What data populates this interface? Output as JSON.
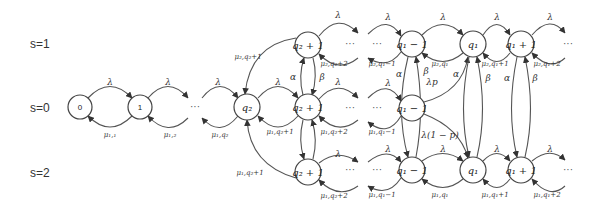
{
  "row_labels": [
    {
      "id": "s1",
      "text": "s=1",
      "x": 30,
      "y": 48
    },
    {
      "id": "s0",
      "text": "s=0",
      "x": 30,
      "y": 112
    },
    {
      "id": "s2",
      "text": "s=2",
      "x": 30,
      "y": 177
    }
  ],
  "nodes": [
    {
      "id": "n0",
      "label": "0",
      "x": 80,
      "y": 107,
      "r": 12,
      "plain": true
    },
    {
      "id": "n1",
      "label": "1",
      "x": 140,
      "y": 107,
      "r": 12,
      "plain": true
    },
    {
      "id": "nq2",
      "label": "q₂",
      "x": 247,
      "y": 107,
      "r": 13
    },
    {
      "id": "nq2p1_s1",
      "label": "q₂ + 1",
      "x": 308,
      "y": 45,
      "r": 13
    },
    {
      "id": "nq2p1_s0",
      "label": "q₂ + 1",
      "x": 308,
      "y": 107,
      "r": 13
    },
    {
      "id": "nq2p1_s2",
      "label": "q₂ + 1",
      "x": 308,
      "y": 172,
      "r": 13
    },
    {
      "id": "nq1m1_s1",
      "label": "q₁ − 1",
      "x": 412,
      "y": 44,
      "r": 13
    },
    {
      "id": "nq1_s1",
      "label": "q₁",
      "x": 473,
      "y": 44,
      "r": 13
    },
    {
      "id": "nq1p1_s1",
      "label": "q₁ + 1",
      "x": 521,
      "y": 44,
      "r": 13
    },
    {
      "id": "nq1m1_s0",
      "label": "q₁ − 1",
      "x": 412,
      "y": 108,
      "r": 13
    },
    {
      "id": "nq1m1_s2",
      "label": "q₁ − 1",
      "x": 412,
      "y": 170,
      "r": 13
    },
    {
      "id": "nq1_s2",
      "label": "q₁",
      "x": 473,
      "y": 170,
      "r": 13
    },
    {
      "id": "nq1p1_s2",
      "label": "q₁ + 1",
      "x": 521,
      "y": 170,
      "r": 13
    }
  ],
  "ellipses": [
    {
      "id": "dots_s0_a",
      "text": "···",
      "x": 195,
      "y": 110
    },
    {
      "id": "dots_s1_a",
      "text": "···",
      "x": 377,
      "y": 47
    },
    {
      "id": "dots_s0_b",
      "text": "···",
      "x": 377,
      "y": 111
    },
    {
      "id": "dots_s2_a",
      "text": "···",
      "x": 377,
      "y": 173
    },
    {
      "id": "dots_s1_end",
      "text": "···",
      "x": 568,
      "y": 47
    },
    {
      "id": "dots_s2_end",
      "text": "···",
      "x": 568,
      "y": 173
    },
    {
      "id": "dots_s0_q2",
      "text": "···",
      "x": 350,
      "y": 111
    },
    {
      "id": "dots_s1_q2",
      "text": "···",
      "x": 350,
      "y": 47
    },
    {
      "id": "dots_s2_q2",
      "text": "···",
      "x": 350,
      "y": 173
    }
  ],
  "edge_labels": [
    {
      "id": "l_lambda_0_1",
      "text": "λ",
      "x": 110,
      "y": 85
    },
    {
      "id": "l_mu_1_0",
      "text": "μ₁,₁",
      "x": 110,
      "y": 137,
      "small": true
    },
    {
      "id": "l_lambda_1_dots",
      "text": "λ",
      "x": 168,
      "y": 85
    },
    {
      "id": "l_mu_dots_1",
      "text": "μ₁,₂",
      "x": 170,
      "y": 137,
      "small": true
    },
    {
      "id": "l_lambda_dots_q2",
      "text": "λ",
      "x": 218,
      "y": 85
    },
    {
      "id": "l_mu_q2_dots",
      "text": "μ₁,q₂",
      "x": 220,
      "y": 137,
      "small": true
    },
    {
      "id": "l_mu2_q2p1",
      "text": "μ₂,q₂+1",
      "x": 248,
      "y": 59,
      "small": true
    },
    {
      "id": "l_lambda_q2_s0",
      "text": "λ",
      "x": 278,
      "y": 85
    },
    {
      "id": "l_mu_q2p1_s0",
      "text": "μ₁,q₂+1",
      "x": 280,
      "y": 134,
      "small": true
    },
    {
      "id": "l_mu1_q2p1_s2",
      "text": "μ₁,q₂+1",
      "x": 250,
      "y": 175,
      "small": true
    },
    {
      "id": "l_alpha_q2",
      "text": "α",
      "x": 293,
      "y": 80
    },
    {
      "id": "l_beta_q2",
      "text": "β",
      "x": 322,
      "y": 80
    },
    {
      "id": "l_lambda_q2p1_s1",
      "text": "λ",
      "x": 338,
      "y": 18
    },
    {
      "id": "l_mu_q2p2_s1",
      "text": "μ₂,q₂+2",
      "x": 334,
      "y": 66,
      "small": true
    },
    {
      "id": "l_lambda_q2p1_s0",
      "text": "λ",
      "x": 338,
      "y": 85
    },
    {
      "id": "l_mu_q2p2_s0",
      "text": "μ₁,q₂+2",
      "x": 334,
      "y": 134,
      "small": true
    },
    {
      "id": "l_lambda_q2p1_s2",
      "text": "λ",
      "x": 338,
      "y": 157
    },
    {
      "id": "l_mu_q2p2_s2",
      "text": "μ₁,q₂+2",
      "x": 334,
      "y": 198,
      "small": true
    },
    {
      "id": "l_lambda_s1_a",
      "text": "λ",
      "x": 388,
      "y": 20
    },
    {
      "id": "l_mu2_q1m1",
      "text": "μ₂,q₁−1",
      "x": 382,
      "y": 66,
      "small": true
    },
    {
      "id": "l_lambda_s1_b",
      "text": "λ",
      "x": 443,
      "y": 20
    },
    {
      "id": "l_mu2_q1",
      "text": "μ₂,q₁",
      "x": 440,
      "y": 66,
      "small": true
    },
    {
      "id": "l_lambda_s1_c",
      "text": "λ",
      "x": 497,
      "y": 20
    },
    {
      "id": "l_mu2_q1p1",
      "text": "μ₂,q₁+1",
      "x": 495,
      "y": 66,
      "small": true
    },
    {
      "id": "l_lambda_s1_d",
      "text": "λ",
      "x": 550,
      "y": 20
    },
    {
      "id": "l_mu2_q1p2",
      "text": "μ₂,q₁+2",
      "x": 547,
      "y": 66,
      "small": true
    },
    {
      "id": "l_alpha_q1m1",
      "text": "α",
      "x": 399,
      "y": 77
    },
    {
      "id": "l_beta_q1m1",
      "text": "β",
      "x": 426,
      "y": 74
    },
    {
      "id": "l_lambda_p",
      "text": "λp",
      "x": 432,
      "y": 85
    },
    {
      "id": "l_alpha_q1",
      "text": "α",
      "x": 456,
      "y": 77
    },
    {
      "id": "l_beta_q1",
      "text": "β",
      "x": 488,
      "y": 81
    },
    {
      "id": "l_alpha_q1p1",
      "text": "α",
      "x": 507,
      "y": 81
    },
    {
      "id": "l_beta_q1p1",
      "text": "β",
      "x": 535,
      "y": 81
    },
    {
      "id": "l_lambda_s0_q1m1",
      "text": "λ",
      "x": 388,
      "y": 86
    },
    {
      "id": "l_mu1_q1m1_s0",
      "text": "μ₁,q₁−1",
      "x": 382,
      "y": 134,
      "small": true
    },
    {
      "id": "l_lambda_1mp",
      "text": "λ(1 − p)",
      "x": 440,
      "y": 138
    },
    {
      "id": "l_lambda_s2_a",
      "text": "λ",
      "x": 388,
      "y": 152
    },
    {
      "id": "l_mu1_q1m1_s2",
      "text": "μ₁,q₁−1",
      "x": 382,
      "y": 197,
      "small": true
    },
    {
      "id": "l_lambda_s2_b",
      "text": "λ",
      "x": 443,
      "y": 152
    },
    {
      "id": "l_mu1_q1_s2",
      "text": "μ₁,q₁",
      "x": 440,
      "y": 197,
      "small": true
    },
    {
      "id": "l_lambda_s2_c",
      "text": "λ",
      "x": 497,
      "y": 152
    },
    {
      "id": "l_mu1_q1p1_s2",
      "text": "μ₁,q₁+1",
      "x": 495,
      "y": 197,
      "small": true
    },
    {
      "id": "l_lambda_s2_d",
      "text": "λ",
      "x": 550,
      "y": 152
    },
    {
      "id": "l_mu1_q1p2_s2",
      "text": "μ₁,q₁+2",
      "x": 547,
      "y": 197,
      "small": true
    }
  ]
}
